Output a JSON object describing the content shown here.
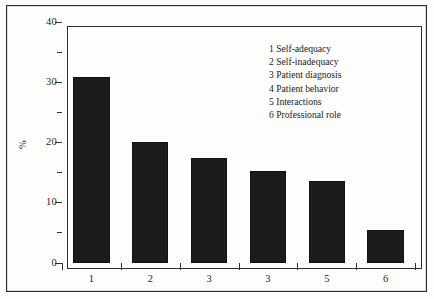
{
  "chart_data": {
    "type": "bar",
    "title": "",
    "xlabel": "",
    "ylabel": "%",
    "categories": [
      "1",
      "2",
      "3",
      "3",
      "5",
      "6"
    ],
    "values": [
      30.8,
      20.1,
      17.4,
      15.2,
      13.6,
      5.5
    ],
    "ylim": [
      0,
      40
    ],
    "yticks": [
      0,
      10,
      20,
      30,
      40
    ],
    "ytick_labels": [
      "0",
      "10",
      "20",
      "30",
      "40"
    ],
    "yminor_ticks": [
      5,
      15,
      25,
      35
    ],
    "grid": false,
    "legend_position": "inside-top-right",
    "legend": [
      {
        "key": "1",
        "text": "Self-adequacy"
      },
      {
        "key": "2",
        "text": "Self-inadequacy"
      },
      {
        "key": "3",
        "text": "Patient diagnosis"
      },
      {
        "key": "4",
        "text": "Patient behavior"
      },
      {
        "key": "5",
        "text": "Interactions"
      },
      {
        "key": "6",
        "text": "Professional role"
      }
    ],
    "bar_color": "#1c1c1c",
    "axis_color": "#2e2e2e",
    "background_color": "#fdfdfb"
  }
}
